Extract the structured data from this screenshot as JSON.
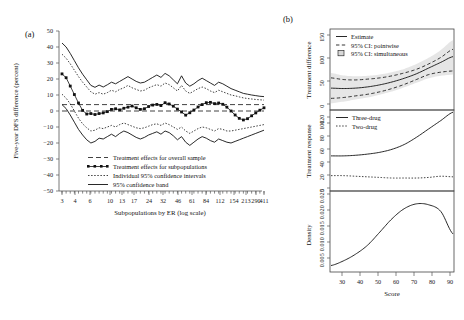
{
  "figure": {
    "panel_a_label": "(a)",
    "panel_b_label": "(b)"
  },
  "panel_a": {
    "ylabel": "Five-year DFS difference (percent)",
    "xlabel": "Subpopulations by ER (log scale)",
    "yticks": [
      "50",
      "40",
      "30",
      "20",
      "10",
      "0",
      "−10",
      "−20",
      "−30",
      "−40",
      "−50"
    ],
    "xticks": [
      "3",
      "4",
      "6",
      "10",
      "13",
      "17",
      "24",
      "32",
      "46",
      "61",
      "84",
      "112",
      "154",
      "213",
      "290",
      "411"
    ],
    "legend": [
      {
        "label": "Treatment effects for overall sample",
        "style": "dash-dot"
      },
      {
        "label": "Treatment effects for subpopulations",
        "style": "line-squares"
      },
      {
        "label": "Individual 95% confidence intervals",
        "style": "dashed"
      },
      {
        "label": "95% confidence band",
        "style": "solid"
      }
    ]
  },
  "panel_b": {
    "top": {
      "ylabel": "Treatment difference",
      "yticks": [
        "0",
        "50",
        "100",
        "150"
      ],
      "legend": [
        {
          "label": "Estimate",
          "style": "solid"
        },
        {
          "label": "95% CI: pointwise",
          "style": "dashed"
        },
        {
          "label": "95% CI: simultaneous",
          "style": "band-marker"
        }
      ]
    },
    "middle": {
      "ylabel": "Treatment response",
      "yticks": [
        "0",
        "20",
        "40",
        "60",
        "80",
        "100",
        "120"
      ],
      "legend": [
        {
          "label": "Three-drug",
          "style": "solid"
        },
        {
          "label": "Two-drug",
          "style": "dotted"
        }
      ]
    },
    "bottom": {
      "ylabel": "Density",
      "yticks": [
        "0.005",
        "0.010",
        "0.015",
        "0.020",
        "0.025"
      ]
    },
    "xlabel": "Score",
    "xticks": [
      "30",
      "40",
      "50",
      "60",
      "70",
      "80",
      "90"
    ]
  },
  "chart_data": [
    {
      "type": "line",
      "title": "(a) Five-year DFS difference by ER subpopulation",
      "xlabel": "Subpopulations by ER (log scale)",
      "ylabel": "Five-year DFS difference (percent)",
      "ylim": [
        -50,
        50
      ],
      "xscale": "log",
      "xtick_values": [
        3,
        4,
        6,
        10,
        13,
        17,
        24,
        32,
        46,
        61,
        84,
        112,
        154,
        213,
        290,
        411
      ],
      "grid": false,
      "legend_position": "bottom-center",
      "overall_effect_line": 4.0,
      "zero_reference_line": 0.0,
      "series": [
        {
          "name": "Treatment effects for subpopulations",
          "style": "line-with-squares",
          "values": [
            23.2,
            20.8,
            15.6,
            10.3,
            5.0,
            0.4,
            -1.9,
            -1.6,
            -2.2,
            -1.6,
            -1.2,
            -0.4,
            1.0,
            1.4,
            0.7,
            1.7,
            2.4,
            3.1,
            2.0,
            1.0,
            1.4,
            2.8,
            3.7,
            4.1,
            3.4,
            5.2,
            4.4,
            3.0,
            1.2,
            -0.6,
            -2.6,
            -1.1,
            0.6,
            2.5,
            4.0,
            5.2,
            5.4,
            4.6,
            5.0,
            4.2,
            2.4,
            0.0,
            -2.5,
            -4.6,
            -5.6,
            -4.8,
            -3.0,
            -1.2,
            0.5,
            2.0
          ]
        },
        {
          "name": "Upper 95% confidence band",
          "style": "solid",
          "values": [
            42.5,
            40.0,
            36.0,
            31.5,
            27.0,
            23.0,
            19.5,
            16.0,
            14.8,
            16.2,
            15.0,
            16.4,
            18.0,
            17.0,
            18.5,
            20.0,
            21.5,
            20.0,
            18.5,
            17.5,
            18.0,
            19.5,
            21.0,
            22.5,
            21.0,
            23.5,
            22.0,
            19.5,
            17.0,
            22.0,
            17.5,
            15.5,
            17.0,
            19.0,
            20.5,
            19.0,
            17.5,
            16.0,
            18.0,
            17.0,
            15.5,
            14.0,
            13.0,
            12.0,
            11.0,
            10.5,
            10.0,
            9.6,
            9.2,
            9.0
          ]
        },
        {
          "name": "Lower 95% confidence band",
          "style": "solid",
          "values": [
            4.0,
            1.5,
            -2.5,
            -7.0,
            -11.5,
            -15.0,
            -18.0,
            -20.0,
            -19.0,
            -17.0,
            -17.5,
            -16.0,
            -14.5,
            -16.0,
            -14.0,
            -12.5,
            -13.5,
            -15.0,
            -16.5,
            -17.5,
            -16.5,
            -15.0,
            -14.0,
            -13.0,
            -14.5,
            -12.5,
            -13.5,
            -15.5,
            -18.0,
            -16.0,
            -19.5,
            -21.5,
            -19.5,
            -17.5,
            -16.0,
            -17.0,
            -18.5,
            -19.5,
            -17.5,
            -18.5,
            -19.5,
            -20.0,
            -19.0,
            -18.0,
            -17.0,
            -16.0,
            -15.0,
            -14.0,
            -13.0,
            -12.0
          ]
        },
        {
          "name": "Upper individual 95% confidence interval",
          "style": "dashed",
          "values": [
            35.5,
            33.0,
            29.5,
            25.5,
            21.5,
            18.0,
            15.0,
            12.0,
            10.5,
            11.5,
            10.5,
            11.5,
            13.0,
            12.0,
            13.5,
            14.5,
            16.0,
            14.5,
            13.5,
            12.5,
            13.0,
            14.5,
            15.5,
            16.5,
            15.5,
            17.5,
            16.5,
            14.5,
            12.5,
            16.0,
            12.5,
            11.0,
            12.5,
            14.0,
            15.0,
            14.0,
            12.5,
            11.5,
            13.0,
            12.0,
            11.0,
            10.0,
            9.5,
            8.8,
            8.2,
            7.8,
            7.5,
            7.2,
            7.0,
            6.8
          ]
        },
        {
          "name": "Lower individual 95% confidence interval",
          "style": "dashed",
          "values": [
            10.5,
            8.0,
            4.5,
            0.0,
            -4.5,
            -8.0,
            -10.5,
            -12.5,
            -12.0,
            -10.5,
            -11.0,
            -10.0,
            -9.0,
            -10.0,
            -8.5,
            -7.5,
            -8.5,
            -9.5,
            -10.5,
            -11.0,
            -10.5,
            -9.5,
            -8.5,
            -8.0,
            -9.0,
            -7.5,
            -8.5,
            -10.0,
            -11.5,
            -10.0,
            -12.5,
            -14.0,
            -12.5,
            -11.0,
            -10.0,
            -10.5,
            -11.5,
            -12.5,
            -11.0,
            -11.5,
            -12.5,
            -12.5,
            -12.0,
            -11.5,
            -11.0,
            -10.5,
            -10.0,
            -9.5,
            -9.0,
            -8.5
          ]
        }
      ]
    },
    {
      "type": "line",
      "title": "(b) top: Treatment difference vs Score",
      "xlabel": "Score",
      "ylabel": "Treatment difference",
      "xlim": [
        28,
        98
      ],
      "ylim": [
        -18,
        175
      ],
      "grid": false,
      "legend_position": "top-left",
      "x": [
        28,
        35,
        42,
        49,
        56,
        63,
        70,
        77,
        84,
        91,
        98
      ],
      "series": [
        {
          "name": "Estimate",
          "style": "solid",
          "values": [
            33,
            32,
            33,
            36,
            41,
            48,
            57,
            68,
            82,
            96,
            110
          ]
        },
        {
          "name": "95% CI: pointwise upper",
          "style": "dashed",
          "values": [
            58,
            54,
            53,
            55,
            58,
            63,
            70,
            79,
            92,
            108,
            128
          ]
        },
        {
          "name": "95% CI: pointwise lower",
          "style": "dashed",
          "values": [
            8,
            10,
            14,
            18,
            24,
            32,
            42,
            54,
            66,
            72,
            75
          ]
        },
        {
          "name": "95% CI: simultaneous upper",
          "style": "band",
          "values": [
            70,
            64,
            62,
            63,
            66,
            72,
            80,
            92,
            107,
            126,
            150
          ]
        },
        {
          "name": "95% CI: simultaneous lower",
          "style": "band",
          "values": [
            -4,
            0,
            5,
            10,
            17,
            25,
            35,
            46,
            57,
            63,
            66
          ]
        }
      ]
    },
    {
      "type": "line",
      "title": "(b) middle: Treatment response vs Score",
      "xlabel": "Score",
      "ylabel": "Treatment response",
      "xlim": [
        28,
        98
      ],
      "ylim": [
        0,
        132
      ],
      "grid": false,
      "legend_position": "top-left",
      "x": [
        28,
        35,
        42,
        49,
        56,
        63,
        70,
        77,
        84,
        91,
        98
      ],
      "series": [
        {
          "name": "Three-drug",
          "style": "solid",
          "values": [
            57,
            57,
            58,
            60,
            63,
            68,
            76,
            88,
            102,
            116,
            130
          ]
        },
        {
          "name": "Two-drug",
          "style": "dotted",
          "values": [
            24,
            24,
            23,
            22,
            21,
            20,
            20,
            20,
            21,
            23,
            22
          ]
        }
      ]
    },
    {
      "type": "line",
      "title": "(b) bottom: Density of Score",
      "xlabel": "Score",
      "ylabel": "Density",
      "xlim": [
        28,
        98
      ],
      "ylim": [
        0,
        0.026
      ],
      "grid": false,
      "x": [
        28,
        35,
        42,
        49,
        56,
        63,
        70,
        77,
        84,
        91,
        98
      ],
      "series": [
        {
          "name": "Density",
          "style": "solid",
          "values": [
            0.0018,
            0.0033,
            0.0055,
            0.0085,
            0.0128,
            0.0172,
            0.0205,
            0.0221,
            0.0218,
            0.0196,
            0.0122
          ]
        }
      ]
    }
  ]
}
